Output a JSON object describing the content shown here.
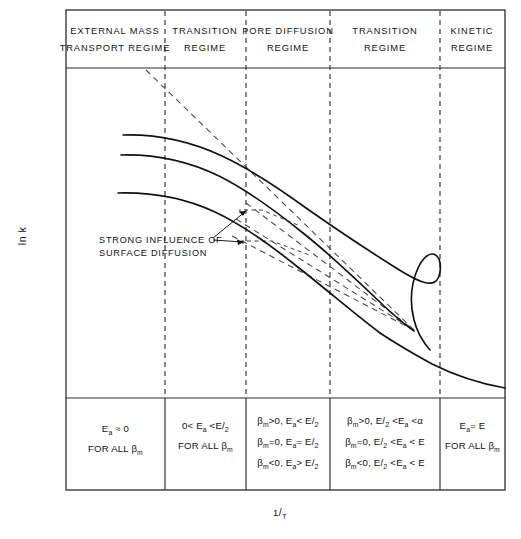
{
  "figure": {
    "type": "scientific-diagram",
    "axes": {
      "y_label": "ln k",
      "x_label_numerator": "1",
      "x_label_denominator": "T",
      "x_label": "1/T"
    },
    "regimes": [
      {
        "id": "external-mass-transport",
        "line1": "EXTERNAL  MASS",
        "line2": "TRANSPORT   REGIME"
      },
      {
        "id": "transition-left",
        "line1": "TRANSITION",
        "line2": "REGIME"
      },
      {
        "id": "pore-diffusion",
        "line1": "PORE DIFFUSION",
        "line2": "REGIME"
      },
      {
        "id": "transition-right",
        "line1": "TRANSITION",
        "line2": "REGIME"
      },
      {
        "id": "kinetic",
        "line1": "KINETIC",
        "line2": "REGIME"
      }
    ],
    "annotation": {
      "line1": "STRONG INFLUENCE OF",
      "line2": "SURFACE  DIFFUSION"
    },
    "bottom_cells": [
      {
        "id": "cell-external-mass-transport",
        "rows": [
          {
            "parts": [
              {
                "t": "E",
                "k": "n"
              },
              {
                "t": "a",
                "k": "sub"
              },
              {
                "t": " ≈ 0",
                "k": "n"
              }
            ]
          },
          {
            "parts": [
              {
                "t": "FOR ALL  β",
                "k": "n"
              },
              {
                "t": "m",
                "k": "sub"
              }
            ]
          }
        ]
      },
      {
        "id": "cell-transition-left",
        "rows": [
          {
            "parts": [
              {
                "t": "0< E",
                "k": "n"
              },
              {
                "t": "a",
                "k": "sub"
              },
              {
                "t": " <E/",
                "k": "n"
              },
              {
                "t": "2",
                "k": "den"
              }
            ]
          },
          {
            "parts": [
              {
                "t": "FOR ALL β",
                "k": "n"
              },
              {
                "t": "m",
                "k": "sub"
              }
            ]
          }
        ]
      },
      {
        "id": "cell-pore-diffusion",
        "rows": [
          {
            "parts": [
              {
                "t": "β",
                "k": "n"
              },
              {
                "t": "m",
                "k": "sub"
              },
              {
                "t": ">0, E",
                "k": "n"
              },
              {
                "t": "a",
                "k": "sub"
              },
              {
                "t": "< E/",
                "k": "n"
              },
              {
                "t": "2",
                "k": "den"
              }
            ]
          },
          {
            "parts": [
              {
                "t": "β",
                "k": "n"
              },
              {
                "t": "m",
                "k": "sub"
              },
              {
                "t": "=0, E",
                "k": "n"
              },
              {
                "t": "a",
                "k": "sub"
              },
              {
                "t": "= E/",
                "k": "n"
              },
              {
                "t": "2",
                "k": "den"
              }
            ]
          },
          {
            "parts": [
              {
                "t": "β",
                "k": "n"
              },
              {
                "t": "m",
                "k": "sub"
              },
              {
                "t": "<0, E",
                "k": "n"
              },
              {
                "t": "a",
                "k": "sub"
              },
              {
                "t": "> E/",
                "k": "n"
              },
              {
                "t": "2",
                "k": "den"
              }
            ]
          }
        ]
      },
      {
        "id": "cell-transition-right",
        "rows": [
          {
            "parts": [
              {
                "t": "β",
                "k": "n"
              },
              {
                "t": "m",
                "k": "sub"
              },
              {
                "t": ">0, E/",
                "k": "n"
              },
              {
                "t": "2",
                "k": "den"
              },
              {
                "t": " <E",
                "k": "n"
              },
              {
                "t": "a",
                "k": "sub"
              },
              {
                "t": " <α",
                "k": "n"
              }
            ]
          },
          {
            "parts": [
              {
                "t": "β",
                "k": "n"
              },
              {
                "t": "m",
                "k": "sub"
              },
              {
                "t": "=0, E/",
                "k": "n"
              },
              {
                "t": "2",
                "k": "den"
              },
              {
                "t": " <E",
                "k": "n"
              },
              {
                "t": "a",
                "k": "sub"
              },
              {
                "t": " < E",
                "k": "n"
              }
            ]
          },
          {
            "parts": [
              {
                "t": "β",
                "k": "n"
              },
              {
                "t": "m",
                "k": "sub"
              },
              {
                "t": "<0, E/",
                "k": "n"
              },
              {
                "t": "2",
                "k": "den"
              },
              {
                "t": " <E",
                "k": "n"
              },
              {
                "t": "a",
                "k": "sub"
              },
              {
                "t": " < E",
                "k": "n"
              }
            ]
          }
        ]
      },
      {
        "id": "cell-kinetic",
        "rows": [
          {
            "parts": [
              {
                "t": "E",
                "k": "n"
              },
              {
                "t": "a",
                "k": "sub"
              },
              {
                "t": "= E",
                "k": "n"
              }
            ]
          },
          {
            "parts": [
              {
                "t": "FOR ALL β",
                "k": "n"
              },
              {
                "t": "m",
                "k": "sub"
              }
            ]
          }
        ]
      }
    ],
    "colors": {
      "line": "#111111",
      "frame": "#2b2b2b",
      "dashed_divider": "#333333",
      "background": "#ffffff"
    },
    "geometry": {
      "frame": {
        "left": 66,
        "right": 505,
        "top": 10,
        "bottom": 490
      },
      "header_bottom": 68,
      "table_top": 398,
      "dividers_x": [
        165,
        246,
        330,
        440
      ]
    }
  }
}
